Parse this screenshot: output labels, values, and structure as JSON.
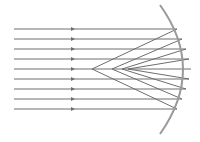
{
  "diagram": {
    "colors": {
      "ray": "#6e6e6e",
      "mirror": "#9a9a9a",
      "background": "#ffffff"
    },
    "rays": {
      "count": 9,
      "start_x": 14,
      "arrow_x": 73,
      "y_positions": [
        29,
        39,
        49,
        59,
        69,
        79,
        89,
        99,
        109
      ]
    },
    "mirror": {
      "top": [
        160,
        5
      ],
      "apex": [
        191,
        69
      ],
      "bottom": [
        160,
        134
      ]
    },
    "focal_region": {
      "nearest_x": 92,
      "farthest_x": 128,
      "y": 69
    }
  }
}
